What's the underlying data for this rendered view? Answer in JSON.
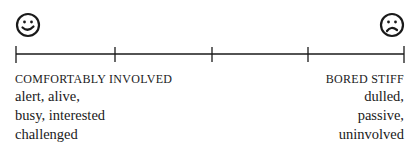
{
  "scale": {
    "ticks": 5,
    "left_face": "happy-face-icon",
    "right_face": "sad-face-icon",
    "line_color": "#1a1a1a"
  },
  "left": {
    "heading": "COMFORTABLY INVOLVED",
    "lines": [
      "alert, alive,",
      "busy, interested",
      "challenged"
    ]
  },
  "right": {
    "heading": "BORED STIFF",
    "lines": [
      "dulled,",
      "passive,",
      "uninvolved"
    ]
  }
}
